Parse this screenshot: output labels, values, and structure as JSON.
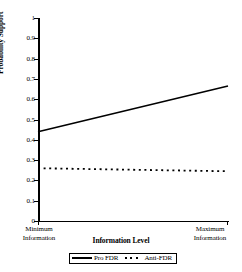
{
  "chart_data": {
    "type": "line",
    "title": "",
    "xlabel": "Information Level",
    "ylabel": "Probability Support",
    "ylim": [
      0,
      1
    ],
    "xlim": [
      0,
      1
    ],
    "grid": false,
    "legend_position": "bottom-center",
    "y_ticks": [
      "0",
      "0.1",
      "0.2",
      "0.3",
      "0.4",
      "0.5",
      "0.6",
      "0.7",
      "0.8",
      "0.9",
      "1"
    ],
    "y_tick_values": [
      0,
      0.1,
      0.2,
      0.3,
      0.4,
      0.5,
      0.6,
      0.7,
      0.8,
      0.9,
      1
    ],
    "x_tick_labels": [
      "Minimum Information",
      "Maximum Information"
    ],
    "x_min_label_line1": "Minimum",
    "x_min_label_line2": "Information",
    "x_max_label_line1": "Maximum",
    "x_max_label_line2": "Information",
    "x": [
      0,
      1
    ],
    "series": [
      {
        "name": "Pro FDR",
        "style": "solid",
        "color": "#000000",
        "values": [
          0.44,
          0.665
        ]
      },
      {
        "name": "Anti-FDR",
        "style": "dotted",
        "color": "#000000",
        "values": [
          0.26,
          0.245
        ]
      }
    ]
  },
  "legend": {
    "entries": [
      {
        "label": "Pro FDR",
        "style": "solid"
      },
      {
        "label": "Anti-FDR",
        "style": "dotted"
      }
    ]
  }
}
